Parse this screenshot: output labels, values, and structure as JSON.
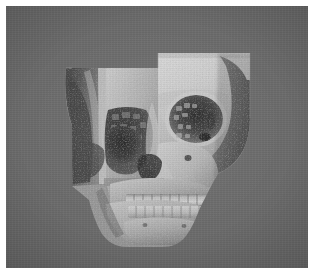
{
  "view": {
    "modality_label": "3D volume rendering",
    "subject_label": "human skull, craniofacial CT",
    "orientation_label": "anterior (frontal) view",
    "colormap_label": "grayscale",
    "background_color": "#6b6b6b",
    "page_margin_color": "#ffffff",
    "canvas": {
      "x": 6,
      "y": 6,
      "width": 302,
      "height": 262
    }
  },
  "render": {
    "bone_bright_color": "#dcdcdc",
    "bone_mid_color": "#b0b0b0",
    "bone_shadow_color": "#7c7c7c",
    "cavity_dark_color": "#2e2e2e",
    "cavity_deep_color": "#1b1b1b",
    "clip_plane_color": "#8d8d8d",
    "teeth_color": "#e4e4e4"
  },
  "clip_planes": [
    {
      "name": "left-sagittal-cut-panel",
      "description": "rectangular clipping plane exposing left paranasal sinuses and orbital floor",
      "x": 66,
      "y": 62,
      "width": 86,
      "height": 118
    },
    {
      "name": "right-coronal-cut-panel",
      "description": "rectangular clipping plane across right frontal bone and orbit",
      "x": 152,
      "y": 47,
      "width": 92,
      "height": 112
    }
  ],
  "anatomy": [
    {
      "name": "frontal-bone",
      "label": "Frontal bone / forehead"
    },
    {
      "name": "right-orbit",
      "label": "Right orbital cavity"
    },
    {
      "name": "left-orbital-floor",
      "label": "Left orbital floor (sectioned)"
    },
    {
      "name": "ethmoid-sinus",
      "label": "Ethmoid air cells"
    },
    {
      "name": "maxillary-sinus",
      "label": "Maxillary sinus (sectioned)"
    },
    {
      "name": "nasal-cavity",
      "label": "Nasal cavity / turbinates"
    },
    {
      "name": "nasal-bone",
      "label": "Nasal bridge"
    },
    {
      "name": "zygomatic-arch",
      "label": "Zygomatic arch"
    },
    {
      "name": "maxilla",
      "label": "Maxilla with upper dentition"
    },
    {
      "name": "mandible",
      "label": "Mandible with lower dentition"
    },
    {
      "name": "mental-protuberance",
      "label": "Chin / mental protuberance"
    },
    {
      "name": "temporal-bone",
      "label": "Temporal bone"
    }
  ],
  "dentition": {
    "upper_teeth_count": 10,
    "lower_teeth_count": 10
  }
}
